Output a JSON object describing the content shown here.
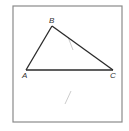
{
  "figure": {
    "type": "triangle",
    "frame": {
      "x": 13,
      "y": 6,
      "width": 109,
      "height": 116,
      "stroke": "#8a8a8a"
    },
    "vertices": [
      {
        "label": "A",
        "x": 26,
        "y": 70,
        "label_x": 22,
        "label_y": 78
      },
      {
        "label": "B",
        "x": 52,
        "y": 26,
        "label_x": 49,
        "label_y": 23
      },
      {
        "label": "C",
        "x": 113,
        "y": 70,
        "label_x": 110,
        "label_y": 78
      }
    ],
    "edges": [
      {
        "from": "A",
        "to": "B"
      },
      {
        "from": "B",
        "to": "C"
      },
      {
        "from": "A",
        "to": "C"
      }
    ],
    "faint_marks": [
      {
        "x1": 68,
        "y1": 37,
        "x2": 73,
        "y2": 50
      },
      {
        "x1": 65,
        "y1": 104,
        "x2": 71,
        "y2": 91
      }
    ],
    "line_color": "#2a2a2a",
    "faint_color": "#c8c8c8"
  }
}
